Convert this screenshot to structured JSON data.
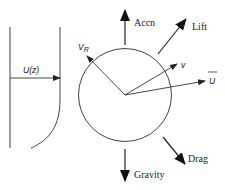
{
  "diagram": {
    "title": "",
    "labels": {
      "profile": "U(z)",
      "relative_velocity": "V",
      "relative_velocity_sub": "R",
      "particle_velocity": "v",
      "mean_flow": "U",
      "acceleration": "Accn",
      "lift": "Lift",
      "gravity": "Gravity",
      "drag": "Drag"
    },
    "colors": {
      "stroke": "#333333",
      "background": "#ffffff"
    }
  }
}
